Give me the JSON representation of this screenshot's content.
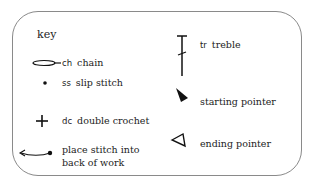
{
  "key": {
    "title": "key",
    "items": [
      {
        "icon": "chain-oval-icon",
        "abbr": "ch",
        "label": "chain"
      },
      {
        "icon": "slip-stitch-dot-icon",
        "abbr": "ss",
        "label": "slip stitch"
      },
      {
        "icon": "double-crochet-plus-icon",
        "abbr": "dc",
        "label": "double crochet"
      },
      {
        "icon": "back-of-work-arrow-icon",
        "abbr": "",
        "label_line1": "place stitch into",
        "label_line2": "back of work"
      },
      {
        "icon": "treble-icon",
        "abbr": "tr",
        "label": "treble"
      },
      {
        "icon": "starting-pointer-icon",
        "abbr": "",
        "label": "starting pointer"
      },
      {
        "icon": "ending-pointer-icon",
        "abbr": "",
        "label": "ending pointer"
      }
    ]
  }
}
